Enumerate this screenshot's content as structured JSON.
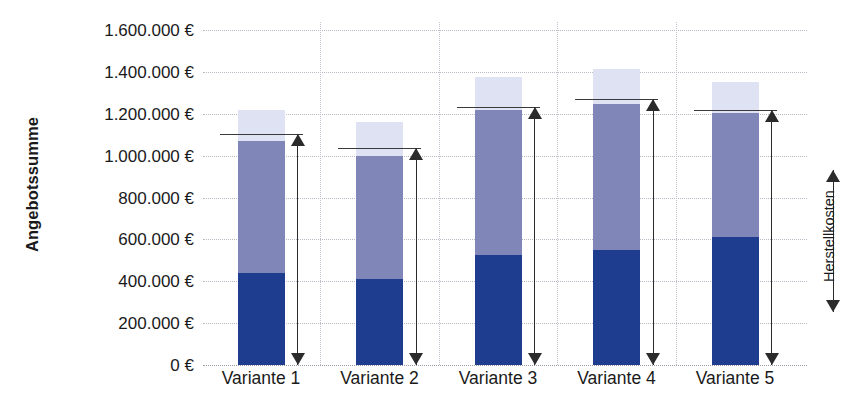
{
  "chart_data": {
    "type": "bar",
    "title": "",
    "subtitle": "",
    "xlabel": "",
    "ylabel": "Angebotssumme",
    "ylim": [
      0,
      1600000
    ],
    "ytick_step": 200000,
    "currency_suffix": "€",
    "grid": true,
    "stacked": true,
    "legend_position": "right",
    "categories": [
      "Variante 1",
      "Variante 2",
      "Variante 3",
      "Variante 4",
      "Variante 5"
    ],
    "ytick_labels": [
      "1.600.000 €",
      "1.400.000 €",
      "1.200.000 €",
      "1.000.000 €",
      "800.000 €",
      "600.000 €",
      "400.000 €",
      "200.000 €",
      "0 €"
    ],
    "ytick_values": [
      1600000,
      1400000,
      1200000,
      1000000,
      800000,
      600000,
      400000,
      200000,
      0
    ],
    "series": [
      {
        "name": "Herstellkosten",
        "color": "#1f3d8f",
        "values": [
          440000,
          410000,
          525000,
          549000,
          611000
        ]
      },
      {
        "name": "Baunebenkosten",
        "color": "#8186b8",
        "values": [
          630000,
          588000,
          693000,
          697000,
          592000
        ]
      },
      {
        "name": "Zuschlag",
        "color": "#dfe2f2",
        "values": [
          148000,
          162000,
          157000,
          167000,
          148000
        ]
      }
    ],
    "bar_totals": [
      1218000,
      1160000,
      1375000,
      1413000,
      1351000
    ],
    "marker_lines": {
      "label": "Angebotssumme",
      "values": [
        1103000,
        1036000,
        1232000,
        1270000,
        1218000
      ]
    },
    "annotations": [
      {
        "name": "herstellkosten-bracket",
        "label": "Herstellkosten",
        "type": "double-arrow",
        "orientation": "vertical"
      }
    ],
    "legend": [
      {
        "label": "Herstellkosten",
        "marker": "double-arrow"
      }
    ]
  },
  "axis": {
    "y_title": "Angebotssumme"
  },
  "legend": {
    "herstellkosten_label": "Herstellkosten"
  }
}
